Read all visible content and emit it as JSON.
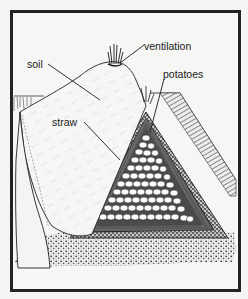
{
  "figure": {
    "frame_color": "#222222",
    "background_color": "#f4f4f2",
    "ink_color": "#1a1a1a"
  },
  "labels": {
    "ventilation": "ventilation",
    "soil": "soil",
    "potatoes": "potatoes",
    "straw": "straw"
  },
  "callouts": [
    {
      "label": "ventilation",
      "text_x": 144,
      "text_y": 41,
      "target": [
        115,
        66
      ]
    },
    {
      "label": "soil",
      "text_x": 27,
      "text_y": 59,
      "target": [
        100,
        100
      ]
    },
    {
      "label": "potatoes",
      "text_x": 163,
      "text_y": 69,
      "target": [
        150,
        132
      ]
    },
    {
      "label": "straw",
      "text_x": 52,
      "text_y": 117,
      "target": [
        118,
        162
      ]
    }
  ]
}
